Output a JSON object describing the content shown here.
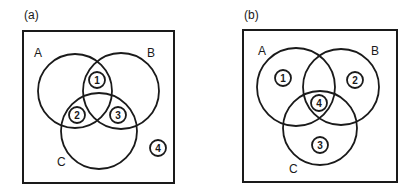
{
  "panels": [
    {
      "label": "(a)",
      "sets": [
        {
          "name": "A"
        },
        {
          "name": "B"
        },
        {
          "name": "C"
        }
      ],
      "regions": [
        {
          "label": "1",
          "location": "A ∩ B only"
        },
        {
          "label": "2",
          "location": "A ∩ C only"
        },
        {
          "label": "3",
          "location": "B ∩ C only"
        },
        {
          "label": "4",
          "location": "outside A, B, C"
        }
      ]
    },
    {
      "label": "(b)",
      "sets": [
        {
          "name": "A"
        },
        {
          "name": "B"
        },
        {
          "name": "C"
        }
      ],
      "regions": [
        {
          "label": "1",
          "location": "A only"
        },
        {
          "label": "2",
          "location": "B only"
        },
        {
          "label": "3",
          "location": "C only"
        },
        {
          "label": "4",
          "location": "A ∩ B ∩ C"
        }
      ]
    }
  ],
  "colors": {
    "stroke": "#1a1a1a",
    "background": "#ffffff"
  }
}
